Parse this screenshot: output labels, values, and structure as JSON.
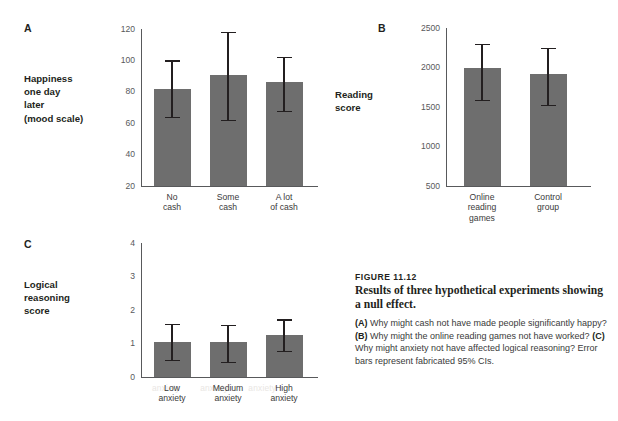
{
  "figure": {
    "number": "FIGURE 11.12",
    "title": "Results of three hypothetical experiments showing a null effect.",
    "body_a_marker": "(A)",
    "body_a_text": " Why might cash not have made people significantly happy? ",
    "body_b_marker": "(B)",
    "body_b_text": " Why might the online reading games not have worked? ",
    "body_c_marker": "(C)",
    "body_c_text": " Why might anxiety not have affected logical reasoning?  Error bars represent fabricated 95% CIs."
  },
  "ghost_text": {
    "line1": "anxiety        anxiety        anxiety"
  },
  "colors": {
    "bar": "#6e6e6e",
    "axis": "#58595b",
    "error_bar": "#231f20",
    "text": "#231f20",
    "background": "#ffffff"
  },
  "chart_data": [
    {
      "type": "bar",
      "panel": "A",
      "title": "",
      "ylabel": "Happiness one day later (mood scale)",
      "ylabel_lines": [
        "Happiness",
        "one day",
        "later",
        "(mood scale)"
      ],
      "xlabel": "",
      "categories": [
        "No cash",
        "Some cash",
        "A lot of cash"
      ],
      "category_lines": [
        [
          "No",
          "cash"
        ],
        [
          "Some",
          "cash"
        ],
        [
          "A lot",
          "of cash"
        ]
      ],
      "values": [
        82,
        91,
        86
      ],
      "error_low": [
        64,
        62,
        68
      ],
      "error_high": [
        100,
        118,
        102
      ],
      "ylim": [
        20,
        120
      ],
      "yticks": [
        20,
        40,
        60,
        80,
        100,
        120
      ],
      "grid": false,
      "legend": "none",
      "error_bar_note": "fabricated 95% CIs"
    },
    {
      "type": "bar",
      "panel": "B",
      "title": "",
      "ylabel": "Reading score",
      "ylabel_lines": [
        "Reading",
        "score"
      ],
      "xlabel": "",
      "categories": [
        "Online reading games",
        "Control group"
      ],
      "category_lines": [
        [
          "Online",
          "reading",
          "games"
        ],
        [
          "Control",
          "group"
        ]
      ],
      "values": [
        1990,
        1920
      ],
      "error_low": [
        1590,
        1530
      ],
      "error_high": [
        2300,
        2250
      ],
      "ylim": [
        500,
        2500
      ],
      "yticks": [
        500,
        1000,
        1500,
        2000,
        2500
      ],
      "grid": false,
      "legend": "none",
      "error_bar_note": "fabricated 95% CIs"
    },
    {
      "type": "bar",
      "panel": "C",
      "title": "",
      "ylabel": "Logical reasoning score",
      "ylabel_lines": [
        "Logical",
        "reasoning",
        "score"
      ],
      "xlabel": "",
      "categories": [
        "Low anxiety",
        "Medium anxiety",
        "High anxiety"
      ],
      "category_lines": [
        [
          "Low",
          "anxiety"
        ],
        [
          "Medium",
          "anxiety"
        ],
        [
          "High",
          "anxiety"
        ]
      ],
      "values": [
        1.05,
        1.03,
        1.25
      ],
      "error_low": [
        0.5,
        0.44,
        0.78
      ],
      "error_high": [
        1.58,
        1.55,
        1.72
      ],
      "ylim": [
        0,
        4
      ],
      "yticks": [
        0,
        1,
        2,
        3,
        4
      ],
      "grid": false,
      "legend": "none",
      "error_bar_note": "fabricated 95% CIs"
    }
  ]
}
